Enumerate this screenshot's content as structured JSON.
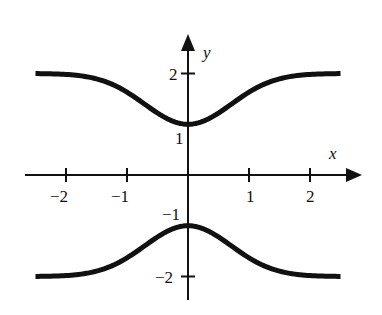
{
  "chart_data": {
    "type": "line",
    "title": "",
    "xlabel": "x",
    "ylabel": "y",
    "xlim": [
      -2.5,
      2.5
    ],
    "ylim": [
      -2.5,
      2.7
    ],
    "grid": false,
    "legend": null,
    "x_ticks": [
      -2,
      -1,
      1,
      2
    ],
    "x_tick_labels": [
      "−2",
      "−1",
      "1",
      "2"
    ],
    "y_ticks": [
      2,
      1,
      -1,
      -2
    ],
    "y_tick_labels": [
      "2",
      "1",
      "−1",
      "−2"
    ],
    "series": [
      {
        "name": "upper branch",
        "description": "approximately y = 2 - e^(-x^2); min 1 at x=0, approaches 2 as |x| grows",
        "x": [
          -2.5,
          -2,
          -1.5,
          -1,
          -0.75,
          -0.5,
          -0.25,
          0,
          0.25,
          0.5,
          0.75,
          1,
          1.5,
          2,
          2.5
        ],
        "values": [
          2.0,
          1.98,
          1.89,
          1.63,
          1.43,
          1.22,
          1.06,
          1.0,
          1.06,
          1.22,
          1.43,
          1.63,
          1.89,
          1.98,
          2.0
        ]
      },
      {
        "name": "lower branch",
        "description": "approximately y = -(2 - e^(-x^2)); max -1 at x=0, approaches -2 as |x| grows",
        "x": [
          -2.5,
          -2,
          -1.5,
          -1,
          -0.75,
          -0.5,
          -0.25,
          0,
          0.25,
          0.5,
          0.75,
          1,
          1.5,
          2,
          2.5
        ],
        "values": [
          -2.0,
          -1.98,
          -1.89,
          -1.63,
          -1.43,
          -1.22,
          -1.06,
          -1.0,
          -1.06,
          -1.22,
          -1.43,
          -1.63,
          -1.89,
          -1.98,
          -2.0
        ]
      }
    ],
    "style": {
      "curve_color": "#111111",
      "axis_color": "#111111",
      "background": "#ffffff"
    }
  },
  "labels": {
    "x_axis": "x",
    "y_axis": "y",
    "xt_m2": "−2",
    "xt_m1": "−1",
    "xt_1": "1",
    "xt_2": "2",
    "yt_2": "2",
    "yt_1": "1",
    "yt_m1": "−1",
    "yt_m2": "−2"
  }
}
